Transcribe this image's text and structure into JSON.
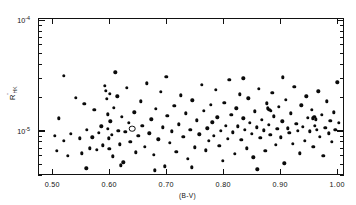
{
  "chart_data": {
    "type": "scatter",
    "title": "",
    "xlabel": "(B-V)",
    "ylabel": "R'_HK",
    "ylabel_parts": {
      "base": "R",
      "prime": "'",
      "sub": "HK"
    },
    "xlim": [
      0.475,
      1.012
    ],
    "ylim": [
      4e-06,
      0.000105
    ],
    "yscale": "log",
    "xscale": "linear",
    "grid": false,
    "legend": null,
    "xticks": [
      0.5,
      0.6,
      0.7,
      0.8,
      0.9,
      1.0
    ],
    "xticklabels": [
      "0.50",
      "0.60",
      "0.70",
      "0.80",
      "0.90",
      "1.00"
    ],
    "yticks": [
      0.0001,
      1e-05
    ],
    "yticklabels": [
      "10",
      "10"
    ],
    "ytick_exponents": [
      "-4",
      "-5"
    ],
    "marker": "filled-circle",
    "marker_special": "open-circle",
    "n_points": 168,
    "points": [
      {
        "x": 0.505,
        "y": 9e-06,
        "m": "f"
      },
      {
        "x": 0.508,
        "y": 6.6e-06,
        "m": "f"
      },
      {
        "x": 0.512,
        "y": 1.3e-05,
        "m": "f"
      },
      {
        "x": 0.52,
        "y": 8.2e-06,
        "m": "f"
      },
      {
        "x": 0.527,
        "y": 6e-06,
        "m": "f"
      },
      {
        "x": 0.533,
        "y": 9.4e-06,
        "m": "f"
      },
      {
        "x": 0.541,
        "y": 2e-05,
        "m": "f"
      },
      {
        "x": 0.548,
        "y": 8.6e-06,
        "m": "f"
      },
      {
        "x": 0.552,
        "y": 6.3e-06,
        "m": "f"
      },
      {
        "x": 0.556,
        "y": 1.75e-05,
        "m": "f"
      },
      {
        "x": 0.561,
        "y": 1.02e-05,
        "m": "f"
      },
      {
        "x": 0.566,
        "y": 7e-06,
        "m": "f"
      },
      {
        "x": 0.57,
        "y": 8.8e-06,
        "m": "f"
      },
      {
        "x": 0.574,
        "y": 1.55e-05,
        "m": "f"
      },
      {
        "x": 0.578,
        "y": 6.8e-06,
        "m": "f"
      },
      {
        "x": 0.582,
        "y": 9.6e-06,
        "m": "f"
      },
      {
        "x": 0.586,
        "y": 1.1e-05,
        "m": "f"
      },
      {
        "x": 0.589,
        "y": 7.4e-06,
        "m": "f"
      },
      {
        "x": 0.592,
        "y": 2.55e-05,
        "m": "f"
      },
      {
        "x": 0.594,
        "y": 2.3e-05,
        "m": "f"
      },
      {
        "x": 0.596,
        "y": 1.95e-05,
        "m": "f"
      },
      {
        "x": 0.597,
        "y": 1.42e-05,
        "m": "f"
      },
      {
        "x": 0.598,
        "y": 1.05e-05,
        "m": "f"
      },
      {
        "x": 0.599,
        "y": 8.6e-06,
        "m": "f"
      },
      {
        "x": 0.6,
        "y": 6.9e-06,
        "m": "f"
      },
      {
        "x": 0.601,
        "y": 2.18e-05,
        "m": "f"
      },
      {
        "x": 0.602,
        "y": 1.22e-05,
        "m": "f"
      },
      {
        "x": 0.604,
        "y": 9.2e-06,
        "m": "f"
      },
      {
        "x": 0.606,
        "y": 5.9e-06,
        "m": "f"
      },
      {
        "x": 0.608,
        "y": 1.62e-05,
        "m": "f"
      },
      {
        "x": 0.611,
        "y": 3.4e-05,
        "m": "f"
      },
      {
        "x": 0.614,
        "y": 2.05e-05,
        "m": "f"
      },
      {
        "x": 0.616,
        "y": 1e-05,
        "m": "f"
      },
      {
        "x": 0.619,
        "y": 7.6e-06,
        "m": "f"
      },
      {
        "x": 0.622,
        "y": 1.35e-05,
        "m": "f"
      },
      {
        "x": 0.625,
        "y": 5.2e-06,
        "m": "f"
      },
      {
        "x": 0.628,
        "y": 9.8e-06,
        "m": "f"
      },
      {
        "x": 0.631,
        "y": 2.45e-05,
        "m": "f"
      },
      {
        "x": 0.634,
        "y": 1.18e-05,
        "m": "f"
      },
      {
        "x": 0.637,
        "y": 8e-06,
        "m": "f"
      },
      {
        "x": 0.64,
        "y": 1.05e-05,
        "m": "o"
      },
      {
        "x": 0.644,
        "y": 1.48e-05,
        "m": "f"
      },
      {
        "x": 0.647,
        "y": 6.4e-06,
        "m": "f"
      },
      {
        "x": 0.651,
        "y": 9.1e-06,
        "m": "f"
      },
      {
        "x": 0.655,
        "y": 1.85e-05,
        "m": "f"
      },
      {
        "x": 0.658,
        "y": 1.12e-05,
        "m": "f"
      },
      {
        "x": 0.662,
        "y": 7.2e-06,
        "m": "f"
      },
      {
        "x": 0.666,
        "y": 2.7e-05,
        "m": "f"
      },
      {
        "x": 0.67,
        "y": 9.5e-06,
        "m": "f"
      },
      {
        "x": 0.674,
        "y": 1.28e-05,
        "m": "f"
      },
      {
        "x": 0.678,
        "y": 6.1e-06,
        "m": "f"
      },
      {
        "x": 0.682,
        "y": 1.58e-05,
        "m": "f"
      },
      {
        "x": 0.686,
        "y": 8.4e-06,
        "m": "f"
      },
      {
        "x": 0.69,
        "y": 2.25e-05,
        "m": "f"
      },
      {
        "x": 0.694,
        "y": 1.08e-05,
        "m": "f"
      },
      {
        "x": 0.698,
        "y": 4.8e-06,
        "m": "f"
      },
      {
        "x": 0.702,
        "y": 1.38e-05,
        "m": "f"
      },
      {
        "x": 0.706,
        "y": 7.8e-06,
        "m": "f"
      },
      {
        "x": 0.71,
        "y": 9.9e-06,
        "m": "f"
      },
      {
        "x": 0.714,
        "y": 1.68e-05,
        "m": "f"
      },
      {
        "x": 0.718,
        "y": 6.5e-06,
        "m": "f"
      },
      {
        "x": 0.722,
        "y": 1.15e-05,
        "m": "f"
      },
      {
        "x": 0.726,
        "y": 2.1e-05,
        "m": "f"
      },
      {
        "x": 0.73,
        "y": 8.9e-06,
        "m": "f"
      },
      {
        "x": 0.734,
        "y": 1.45e-05,
        "m": "f"
      },
      {
        "x": 0.738,
        "y": 5.6e-06,
        "m": "f"
      },
      {
        "x": 0.742,
        "y": 1.02e-05,
        "m": "f"
      },
      {
        "x": 0.746,
        "y": 1.9e-05,
        "m": "f"
      },
      {
        "x": 0.75,
        "y": 7.1e-06,
        "m": "f"
      },
      {
        "x": 0.754,
        "y": 1.25e-05,
        "m": "f"
      },
      {
        "x": 0.758,
        "y": 9.3e-06,
        "m": "f"
      },
      {
        "x": 0.762,
        "y": 2.6e-05,
        "m": "f"
      },
      {
        "x": 0.766,
        "y": 1.52e-05,
        "m": "f"
      },
      {
        "x": 0.769,
        "y": 6.7e-06,
        "m": "f"
      },
      {
        "x": 0.772,
        "y": 1.06e-05,
        "m": "f"
      },
      {
        "x": 0.775,
        "y": 8.1e-06,
        "m": "f"
      },
      {
        "x": 0.778,
        "y": 1.72e-05,
        "m": "f"
      },
      {
        "x": 0.781,
        "y": 1.2e-05,
        "m": "f"
      },
      {
        "x": 0.784,
        "y": 9e-06,
        "m": "f"
      },
      {
        "x": 0.787,
        "y": 2.35e-05,
        "m": "f"
      },
      {
        "x": 0.79,
        "y": 1.33e-05,
        "m": "f"
      },
      {
        "x": 0.793,
        "y": 7.3e-06,
        "m": "f"
      },
      {
        "x": 0.796,
        "y": 1e-05,
        "m": "f"
      },
      {
        "x": 0.799,
        "y": 5.4e-06,
        "m": "f"
      },
      {
        "x": 0.802,
        "y": 1.8e-05,
        "m": "f"
      },
      {
        "x": 0.805,
        "y": 1.12e-05,
        "m": "f"
      },
      {
        "x": 0.808,
        "y": 8.5e-06,
        "m": "f"
      },
      {
        "x": 0.811,
        "y": 2.9e-05,
        "m": "f"
      },
      {
        "x": 0.814,
        "y": 1.4e-05,
        "m": "f"
      },
      {
        "x": 0.817,
        "y": 9.7e-06,
        "m": "f"
      },
      {
        "x": 0.82,
        "y": 6.2e-06,
        "m": "f"
      },
      {
        "x": 0.823,
        "y": 1.6e-05,
        "m": "f"
      },
      {
        "x": 0.826,
        "y": 1.1e-05,
        "m": "f"
      },
      {
        "x": 0.829,
        "y": 2.15e-05,
        "m": "f"
      },
      {
        "x": 0.832,
        "y": 8.3e-06,
        "m": "f"
      },
      {
        "x": 0.835,
        "y": 1.3e-05,
        "m": "f"
      },
      {
        "x": 0.838,
        "y": 1.02e-05,
        "m": "f"
      },
      {
        "x": 0.841,
        "y": 7e-06,
        "m": "f"
      },
      {
        "x": 0.844,
        "y": 1.98e-05,
        "m": "f"
      },
      {
        "x": 0.847,
        "y": 1.18e-05,
        "m": "f"
      },
      {
        "x": 0.85,
        "y": 9.4e-06,
        "m": "f"
      },
      {
        "x": 0.853,
        "y": 5.8e-06,
        "m": "f"
      },
      {
        "x": 0.856,
        "y": 1.5e-05,
        "m": "f"
      },
      {
        "x": 0.859,
        "y": 1.08e-05,
        "m": "f"
      },
      {
        "x": 0.862,
        "y": 2.42e-05,
        "m": "f"
      },
      {
        "x": 0.865,
        "y": 8.7e-06,
        "m": "f"
      },
      {
        "x": 0.868,
        "y": 1.26e-05,
        "m": "f"
      },
      {
        "x": 0.871,
        "y": 1.01e-05,
        "m": "f"
      },
      {
        "x": 0.874,
        "y": 6.6e-06,
        "m": "f"
      },
      {
        "x": 0.877,
        "y": 1.78e-05,
        "m": "f"
      },
      {
        "x": 0.88,
        "y": 1.14e-05,
        "m": "f"
      },
      {
        "x": 0.883,
        "y": 9.2e-06,
        "m": "f"
      },
      {
        "x": 0.886,
        "y": 2.2e-05,
        "m": "f"
      },
      {
        "x": 0.889,
        "y": 1.36e-05,
        "m": "f"
      },
      {
        "x": 0.892,
        "y": 7.5e-06,
        "m": "f"
      },
      {
        "x": 0.895,
        "y": 1.04e-05,
        "m": "f"
      },
      {
        "x": 0.898,
        "y": 1.65e-05,
        "m": "f"
      },
      {
        "x": 0.901,
        "y": 8.8e-06,
        "m": "f"
      },
      {
        "x": 0.904,
        "y": 1.22e-05,
        "m": "f"
      },
      {
        "x": 0.907,
        "y": 5.1e-06,
        "m": "f"
      },
      {
        "x": 0.91,
        "y": 1.92e-05,
        "m": "f"
      },
      {
        "x": 0.913,
        "y": 1.06e-05,
        "m": "f"
      },
      {
        "x": 0.916,
        "y": 9.6e-06,
        "m": "f"
      },
      {
        "x": 0.919,
        "y": 1.44e-05,
        "m": "f"
      },
      {
        "x": 0.922,
        "y": 7.7e-06,
        "m": "f"
      },
      {
        "x": 0.925,
        "y": 2.5e-05,
        "m": "f"
      },
      {
        "x": 0.928,
        "y": 1.16e-05,
        "m": "f"
      },
      {
        "x": 0.931,
        "y": 1e-05,
        "m": "f"
      },
      {
        "x": 0.934,
        "y": 6.3e-06,
        "m": "f"
      },
      {
        "x": 0.937,
        "y": 1.7e-05,
        "m": "f"
      },
      {
        "x": 0.94,
        "y": 1.09e-05,
        "m": "f"
      },
      {
        "x": 0.943,
        "y": 8.2e-06,
        "m": "f"
      },
      {
        "x": 0.946,
        "y": 2.05e-05,
        "m": "f"
      },
      {
        "x": 0.949,
        "y": 1.32e-05,
        "m": "f"
      },
      {
        "x": 0.952,
        "y": 9.9e-06,
        "m": "f"
      },
      {
        "x": 0.955,
        "y": 1.55e-05,
        "m": "f"
      },
      {
        "x": 0.958,
        "y": 7.2e-06,
        "m": "f"
      },
      {
        "x": 0.961,
        "y": 1.12e-05,
        "m": "f"
      },
      {
        "x": 0.964,
        "y": 1.03e-05,
        "m": "f"
      },
      {
        "x": 0.967,
        "y": 2.28e-05,
        "m": "f"
      },
      {
        "x": 0.97,
        "y": 8.9e-06,
        "m": "f"
      },
      {
        "x": 0.973,
        "y": 1.4e-05,
        "m": "f"
      },
      {
        "x": 0.976,
        "y": 6e-06,
        "m": "f"
      },
      {
        "x": 0.979,
        "y": 1.07e-05,
        "m": "f"
      },
      {
        "x": 0.982,
        "y": 1.85e-05,
        "m": "f"
      },
      {
        "x": 0.985,
        "y": 9.5e-06,
        "m": "f"
      },
      {
        "x": 0.988,
        "y": 1.24e-05,
        "m": "f"
      },
      {
        "x": 0.991,
        "y": 8e-06,
        "m": "f"
      },
      {
        "x": 0.994,
        "y": 1.48e-05,
        "m": "f"
      },
      {
        "x": 0.997,
        "y": 1.02e-05,
        "m": "f"
      },
      {
        "x": 1.0,
        "y": 2.75e-05,
        "m": "f"
      },
      {
        "x": 1.003,
        "y": 1.18e-05,
        "m": "f"
      },
      {
        "x": 0.56,
        "y": 4.6e-06,
        "m": "f"
      },
      {
        "x": 0.62,
        "y": 4.9e-06,
        "m": "f"
      },
      {
        "x": 0.68,
        "y": 4.4e-06,
        "m": "f"
      },
      {
        "x": 0.745,
        "y": 4.7e-06,
        "m": "f"
      },
      {
        "x": 0.86,
        "y": 4.5e-06,
        "m": "f"
      },
      {
        "x": 0.905,
        "y": 3.05e-05,
        "m": "f"
      },
      {
        "x": 0.835,
        "y": 3e-05,
        "m": "f"
      },
      {
        "x": 0.7,
        "y": 3.1e-05,
        "m": "f"
      },
      {
        "x": 0.52,
        "y": 3.15e-05,
        "m": "f"
      },
      {
        "x": 0.96,
        "y": 1.35e-05,
        "m": "f"
      },
      {
        "x": 0.963,
        "y": 1.28e-05,
        "m": "f"
      },
      {
        "x": 0.957,
        "y": 1.3e-05,
        "m": "f"
      },
      {
        "x": 0.878,
        "y": 1.6e-05,
        "m": "f"
      },
      {
        "x": 0.881,
        "y": 1.56e-05,
        "m": "f"
      },
      {
        "x": 0.884,
        "y": 1.52e-05,
        "m": "f"
      }
    ]
  }
}
